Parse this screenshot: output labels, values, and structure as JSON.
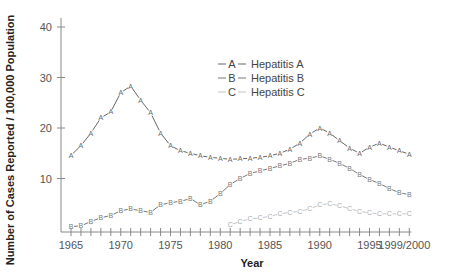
{
  "chart_data": {
    "type": "line",
    "title": "",
    "xlabel": "Year",
    "ylabel": "Number of Cases Reported / 100,000 Population",
    "ylim": [
      0,
      40
    ],
    "yticks": [
      10,
      20,
      30,
      40
    ],
    "xtick_labels": [
      "1965",
      "1970",
      "1975",
      "1980",
      "1985",
      "1990",
      "1995",
      "1999/2000"
    ],
    "grid": false,
    "legend_position": "upper center",
    "x": [
      1966,
      1967,
      1968,
      1969,
      1970,
      1971,
      1972,
      1973,
      1974,
      1975,
      1976,
      1977,
      1978,
      1979,
      1980,
      1981,
      1982,
      1983,
      1984,
      1985,
      1986,
      1987,
      1988,
      1989,
      1990,
      1991,
      1992,
      1993,
      1994,
      1995,
      1996,
      1997,
      1998,
      1999,
      2000
    ],
    "series": [
      {
        "name": "Hepatitis A",
        "marker": "A",
        "color": "#666666",
        "values": [
          14.6,
          16.5,
          19.0,
          22.0,
          23.2,
          27.0,
          28.3,
          25.5,
          23.0,
          19.0,
          16.5,
          15.5,
          15.0,
          14.5,
          14.2,
          14.0,
          13.8,
          13.9,
          14.0,
          14.2,
          14.5,
          15.0,
          15.8,
          17.0,
          18.8,
          20.0,
          19.0,
          17.5,
          16.0,
          15.0,
          16.2,
          17.0,
          16.2,
          15.5,
          14.8
        ]
      },
      {
        "name": "Hepatitis B",
        "marker": "B",
        "color": "#777777",
        "values": [
          0.5,
          0.6,
          1.5,
          2.2,
          2.7,
          3.6,
          4.0,
          3.6,
          3.3,
          4.8,
          5.2,
          5.5,
          6.0,
          4.8,
          5.5,
          7.0,
          8.8,
          10.0,
          11.0,
          11.5,
          12.0,
          12.5,
          13.0,
          13.8,
          14.0,
          14.5,
          13.8,
          13.0,
          12.0,
          10.8,
          9.8,
          9.0,
          8.0,
          7.2,
          6.8
        ]
      },
      {
        "name": "Hepatitis C",
        "marker": "C",
        "color": "#999999",
        "values": [
          null,
          null,
          null,
          null,
          null,
          null,
          null,
          null,
          null,
          null,
          null,
          null,
          null,
          null,
          null,
          null,
          0.8,
          1.5,
          2.0,
          2.2,
          2.5,
          3.0,
          3.3,
          3.5,
          4.0,
          4.8,
          5.0,
          4.6,
          4.0,
          3.5,
          3.2,
          3.0,
          3.0,
          3.0,
          3.0
        ]
      }
    ]
  },
  "legend": {
    "items": [
      {
        "marker": "A",
        "label": "Hepatitis A"
      },
      {
        "marker": "B",
        "label": "Hepatitis B"
      },
      {
        "marker": "C",
        "label": "Hepatitis C"
      }
    ]
  },
  "axes": {
    "xlabel": "Year",
    "ylabel": "Number of Cases Reported / 100,000 Population"
  },
  "colors": {
    "axis": "#888888",
    "series_a": "#666666",
    "series_b": "#777777",
    "series_c": "#aaaaaa"
  }
}
